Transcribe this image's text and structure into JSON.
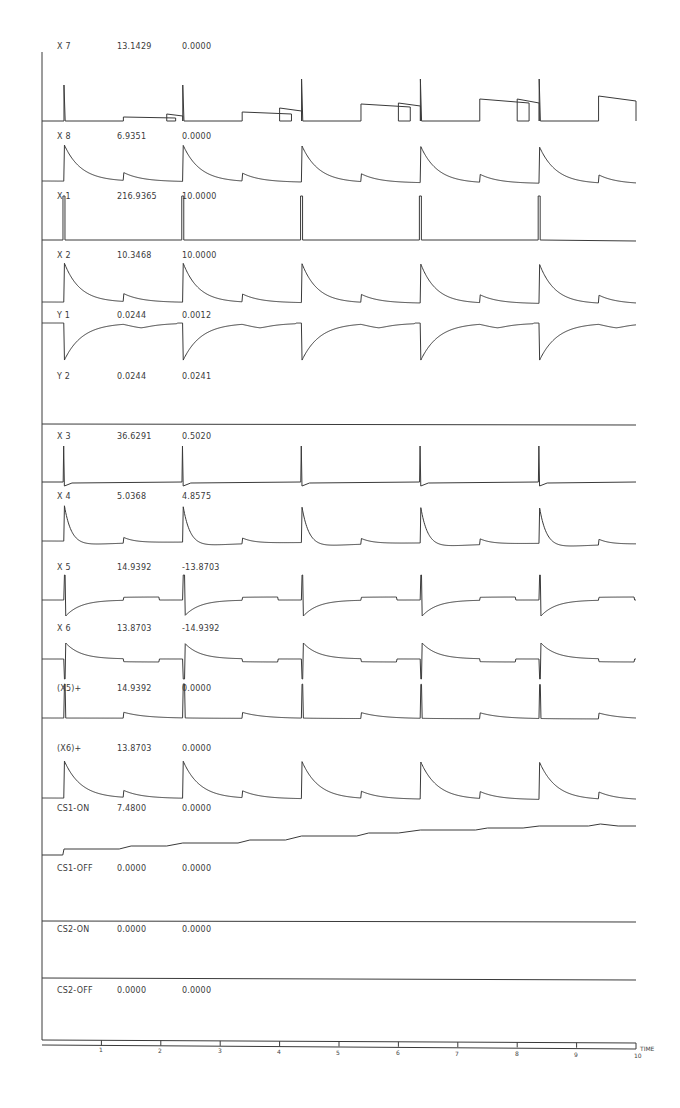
{
  "chart_data": {
    "type": "line",
    "title": "",
    "xlabel": "TIME",
    "ylabel": "",
    "xlim": [
      0,
      10
    ],
    "x_ticks": [
      "1",
      "2",
      "3",
      "4",
      "5",
      "6",
      "7",
      "8",
      "9",
      "10"
    ],
    "grid": false,
    "legend": "none (each trace labelled with name, max, min)",
    "layout": "stacked strip-chart traces sharing a common time axis",
    "major_pulse_times": [
      0.37,
      2.37,
      4.37,
      6.37,
      8.37
    ],
    "minor_event_times": [
      1.37,
      3.37,
      5.37,
      7.37,
      9.37
    ],
    "series": [
      {
        "name": "X 7",
        "max": "13.1429",
        "min": "0.0000",
        "shape": "spike at major pulses; rectangular plateaus between pulses growing in height over time"
      },
      {
        "name": "X 8",
        "max": "6.9351",
        "min": "0.0000",
        "shape": "spike with exponential decay at major pulses; small bumps at minor events"
      },
      {
        "name": "X 1",
        "max": "216.9365",
        "min": "10.0000",
        "shape": "narrow rectangular pulses at major pulse times"
      },
      {
        "name": "X 2",
        "max": "10.3468",
        "min": "10.0000",
        "shape": "spike with exponential decay at major pulses; small bumps at minor events"
      },
      {
        "name": "Y 1",
        "max": "0.0244",
        "min": "0.0012",
        "shape": "sharp dips at major pulses recovering exponentially; shallow dips at minor events"
      },
      {
        "name": "Y 2",
        "max": "0.0244",
        "min": "0.0241",
        "shape": "essentially flat"
      },
      {
        "name": "X 3",
        "max": "36.6291",
        "min": "0.5020",
        "shape": "narrow spikes at major pulses; nearly flat otherwise"
      },
      {
        "name": "X 4",
        "max": "5.0368",
        "min": "4.8575",
        "shape": "spike with decay and undershoot at major pulses; small bumps at minor events"
      },
      {
        "name": "X 5",
        "max": "14.9392",
        "min": "-13.8703",
        "shape": "bipolar spike, negative recovery at major pulses; small steps at minor events"
      },
      {
        "name": "X 6",
        "max": "13.8703",
        "min": "-14.9392",
        "shape": "bipolar spike, positive decay at major pulses; small steps at minor events"
      },
      {
        "name": "(X5)+",
        "max": "14.9392",
        "min": "0.0000",
        "shape": "narrow spikes at major pulses; small decaying bumps at minor events"
      },
      {
        "name": "(X6)+",
        "max": "13.8703",
        "min": "0.0000",
        "shape": "spike with exponential decay at major pulses; small bumps at minor events"
      },
      {
        "name": "CS1-ON",
        "max": "7.4800",
        "min": "0.0000",
        "shape": "monotonic staircase rising from 0 to max"
      },
      {
        "name": "CS1-OFF",
        "max": "0.0000",
        "min": "0.0000",
        "shape": "flat zero"
      },
      {
        "name": "CS2-ON",
        "max": "0.0000",
        "min": "0.0000",
        "shape": "flat zero"
      },
      {
        "name": "CS2-OFF",
        "max": "0.0000",
        "min": "0.0000",
        "shape": "flat zero"
      }
    ]
  },
  "labels": {
    "x7": {
      "name": "X 7",
      "max": "13.1429",
      "min": "0.0000"
    },
    "x8": {
      "name": "X 8",
      "max": "6.9351",
      "min": "0.0000"
    },
    "x1": {
      "name": "X 1",
      "max": "216.9365",
      "min": "10.0000"
    },
    "x2": {
      "name": "X 2",
      "max": "10.3468",
      "min": "10.0000"
    },
    "y1": {
      "name": "Y 1",
      "max": "0.0244",
      "min": "0.0012"
    },
    "y2": {
      "name": "Y 2",
      "max": "0.0244",
      "min": "0.0241"
    },
    "x3": {
      "name": "X 3",
      "max": "36.6291",
      "min": "0.5020"
    },
    "x4": {
      "name": "X 4",
      "max": "5.0368",
      "min": "4.8575"
    },
    "x5": {
      "name": "X 5",
      "max": "14.9392",
      "min": "-13.8703"
    },
    "x6": {
      "name": "X 6",
      "max": "13.8703",
      "min": "-14.9392"
    },
    "x5p": {
      "name": "(X5)+",
      "max": "14.9392",
      "min": "0.0000"
    },
    "x6p": {
      "name": "(X6)+",
      "max": "13.8703",
      "min": "0.0000"
    },
    "cs1on": {
      "name": "CS1-ON",
      "max": "7.4800",
      "min": "0.0000"
    },
    "cs1off": {
      "name": "CS1-OFF",
      "max": "0.0000",
      "min": "0.0000"
    },
    "cs2on": {
      "name": "CS2-ON",
      "max": "0.0000",
      "min": "0.0000"
    },
    "cs2off": {
      "name": "CS2-OFF",
      "max": "0.0000",
      "min": "0.0000"
    }
  },
  "axis": {
    "ticks": [
      "1",
      "2",
      "3",
      "4",
      "5",
      "6",
      "7",
      "8",
      "9",
      "10"
    ],
    "label": "TIME"
  },
  "colors": {
    "ink": "#3a3a3a",
    "background": "#ffffff"
  }
}
